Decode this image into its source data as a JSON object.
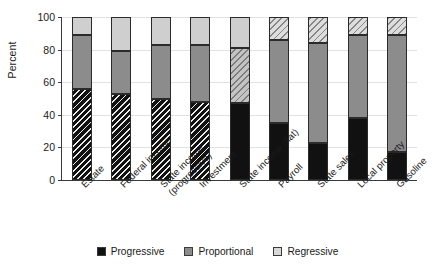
{
  "chart_data": {
    "type": "bar",
    "subtype": "stacked-bar-100",
    "title": "",
    "xlabel": "",
    "ylabel": "Percent",
    "ylim": [
      0,
      100
    ],
    "yticks": [
      0,
      20,
      40,
      60,
      80,
      100
    ],
    "grid": true,
    "legend_position": "bottom",
    "categories": [
      "Estate",
      "Federal income",
      "State income\n(progressive)",
      "Investment",
      "State income (flat)",
      "Payroll",
      "State sales",
      "Local property",
      "Gasoline"
    ],
    "series": [
      {
        "name": "Progressive",
        "color": "#111111",
        "values": [
          56,
          53,
          50,
          48,
          47,
          35,
          23,
          38,
          17
        ]
      },
      {
        "name": "Proportional",
        "color": "#8c8c8c",
        "values": [
          33,
          26,
          33,
          35,
          34,
          51,
          61,
          51,
          72
        ]
      },
      {
        "name": "Regressive",
        "color": "#cfcfcf",
        "values": [
          11,
          21,
          17,
          17,
          19,
          14,
          16,
          11,
          11
        ]
      }
    ],
    "cumulative_tops": [
      [
        56,
        89,
        100
      ],
      [
        53,
        79,
        100
      ],
      [
        50,
        83,
        100
      ],
      [
        48,
        83,
        100
      ],
      [
        47,
        81,
        100
      ],
      [
        35,
        86,
        100
      ],
      [
        23,
        84,
        100
      ],
      [
        38,
        89,
        100
      ],
      [
        17,
        89,
        100
      ]
    ],
    "segment_styles": [
      [
        "hatch-prog",
        "seg-prop",
        "seg-regr"
      ],
      [
        "hatch-prog",
        "seg-prop",
        "seg-regr"
      ],
      [
        "hatch-prog",
        "seg-prop",
        "seg-regr"
      ],
      [
        "hatch-prog",
        "seg-prop",
        "seg-regr"
      ],
      [
        "seg-prog",
        "hatch-prop",
        "seg-regr"
      ],
      [
        "seg-prog",
        "seg-prop",
        "hatch-regr"
      ],
      [
        "seg-prog",
        "seg-prop",
        "hatch-regr"
      ],
      [
        "seg-prog",
        "seg-prop",
        "hatch-regr"
      ],
      [
        "seg-prog",
        "seg-prop",
        "hatch-regr"
      ]
    ]
  },
  "axis": {
    "ylabel": "Percent",
    "ytick_labels": [
      "0",
      "20",
      "40",
      "60",
      "80",
      "100"
    ]
  },
  "legend": {
    "items": [
      {
        "label": "Progressive",
        "swatch": "sw-prog"
      },
      {
        "label": "Proportional",
        "swatch": "sw-prop"
      },
      {
        "label": "Regressive",
        "swatch": "sw-regr"
      }
    ]
  }
}
